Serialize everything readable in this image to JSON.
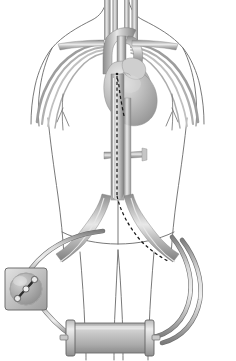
{
  "figure": {
    "background_color": "#ffffff",
    "faint_header_text": ""
  },
  "palette": {
    "body_outline": "#6a6a6a",
    "vessel_mid": "#9a9a9a",
    "vessel_dark": "#7c7c7c",
    "vessel_light": "#c9c9c9",
    "vessel_highlight": "#e4e4e4",
    "heart_fill": "#b9b9b9",
    "heart_highlight": "#dcdcdc",
    "heart_shadow": "#8f8f8f",
    "catheter_dash": "#1a1a1a",
    "tube_outer": "#8d8d8d",
    "tube_inner": "#d6d6d6",
    "device_body": "#b4b4b4",
    "device_light": "#dddddd",
    "device_dark": "#8a8a8a",
    "device_edge": "#6e6e6e"
  },
  "anatomy": {
    "body": {
      "name": "torso-outline",
      "label": "Human torso, frontal view, shoulders to upper thighs"
    },
    "vessels": [
      {
        "name": "right-common-carotid-artery",
        "label": "Right common carotid artery",
        "side": "right"
      },
      {
        "name": "left-common-carotid-artery",
        "label": "Left common carotid artery",
        "side": "left"
      },
      {
        "name": "right-internal-jugular-vein",
        "label": "Right internal jugular vein",
        "side": "right"
      },
      {
        "name": "left-internal-jugular-vein",
        "label": "Left internal jugular vein",
        "side": "left"
      },
      {
        "name": "right-subclavian-vessels",
        "label": "Right subclavian artery and vein",
        "side": "right"
      },
      {
        "name": "left-subclavian-vessels",
        "label": "Left subclavian artery and vein",
        "side": "left"
      },
      {
        "name": "aortic-arch",
        "label": "Aortic arch"
      },
      {
        "name": "superior-vena-cava",
        "label": "Superior vena cava"
      },
      {
        "name": "descending-thoracic-aorta",
        "label": "Descending thoracic aorta"
      },
      {
        "name": "abdominal-aorta",
        "label": "Abdominal aorta"
      },
      {
        "name": "inferior-vena-cava",
        "label": "Inferior vena cava"
      },
      {
        "name": "renal-arteries",
        "label": "Renal arteries"
      },
      {
        "name": "aortic-bifurcation",
        "label": "Aortic bifurcation"
      },
      {
        "name": "right-common-iliac-artery",
        "label": "Right common iliac artery",
        "side": "right"
      },
      {
        "name": "left-common-iliac-artery",
        "label": "Left common iliac artery",
        "side": "left"
      },
      {
        "name": "right-femoral-artery",
        "label": "Right femoral artery",
        "side": "right"
      },
      {
        "name": "left-femoral-artery",
        "label": "Left femoral artery",
        "side": "left"
      }
    ],
    "heart": {
      "name": "heart",
      "label": "Heart",
      "chambers": [
        "right atrium",
        "right ventricle",
        "left ventricle",
        "pulmonary trunk"
      ]
    },
    "catheter": {
      "name": "intravascular-catheter",
      "label": "Intravascular catheter / guidewire",
      "style": "dashed",
      "path_description": "From left femoral access up through iliac artery and aorta to the heart"
    }
  },
  "circuit": {
    "label": "Extracorporeal circuit",
    "pump": {
      "name": "centrifugal-blood-pump",
      "label": "Centrifugal blood pump",
      "shape": "rounded square housing with circular rotor",
      "rotor": "S-shaped impeller",
      "position": "lower left"
    },
    "oxygenator": {
      "name": "membrane-oxygenator",
      "label": "Membrane oxygenator / heat exchanger",
      "shape": "horizontal cylinder with end caps",
      "position": "bottom center"
    },
    "tubes": [
      {
        "name": "drainage-cannula-tube",
        "label": "Venous drainage line",
        "from": "left groin / femoral vein",
        "to": "centrifugal blood pump inlet"
      },
      {
        "name": "pump-to-oxygenator-tube",
        "label": "Pump outflow line",
        "from": "centrifugal blood pump outlet",
        "to": "oxygenator left port"
      },
      {
        "name": "return-cannula-tube",
        "label": "Arterial return line",
        "from": "oxygenator right port",
        "to": "right groin / femoral artery"
      }
    ]
  }
}
